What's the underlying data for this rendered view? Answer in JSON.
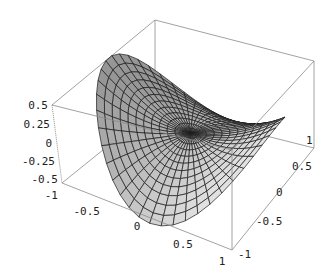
{
  "chart_data": {
    "type": "surface3d",
    "title": "",
    "xlabel": "",
    "ylabel": "",
    "zlabel": "",
    "x_ticks": [
      "-1",
      "-0.5",
      "0",
      "0.5",
      "1"
    ],
    "y_ticks": [
      "-1",
      "-0.5",
      "0",
      "0.5",
      "1"
    ],
    "z_ticks": [
      "0.5",
      "0.25",
      "0",
      "-0.25",
      "-0.5"
    ],
    "xlim": [
      -1,
      1
    ],
    "ylim": [
      -1,
      1
    ],
    "zlim": [
      -0.5,
      0.5
    ],
    "mesh": {
      "radial_lines": 24,
      "circular_lines": 12
    },
    "surface_color": "#bdbdbd",
    "mesh_color": "#1a1a1a",
    "box": true,
    "grid": false
  },
  "labels": {
    "z": [
      "0.5",
      "0.25",
      "0",
      "-0.25",
      "-0.5"
    ],
    "x": [
      "-1",
      "-0.5",
      "0",
      "0.5",
      "1"
    ],
    "y": [
      "-1",
      "-0.5",
      "0",
      "0.5",
      "1"
    ]
  }
}
